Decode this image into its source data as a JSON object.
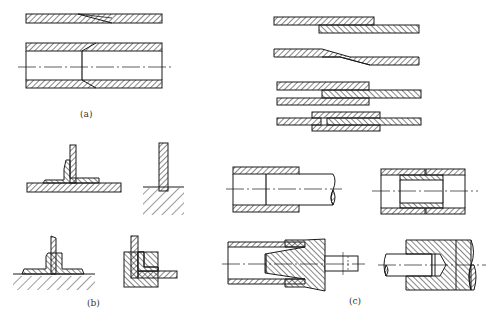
{
  "figure": {
    "type": "engineering joint cross-section drawings",
    "line_color": "#1a1a1a",
    "background": "#ffffff",
    "panels": [
      {
        "id": "a",
        "label": "(a)",
        "description": "Tube/plate scarf joints",
        "items": [
          "scarf-joint-plate",
          "scarf-joint-tube"
        ]
      },
      {
        "id": "top-right",
        "label": "",
        "description": "Plate lap joints",
        "items": [
          "lap-joint-simple",
          "lap-joint-joggled",
          "double-lap-joint",
          "double-strap-butt-joint"
        ]
      },
      {
        "id": "b",
        "label": "(b)",
        "description": "T-joints and corner joints",
        "items": [
          "t-joint-single-doubler",
          "t-joint-embedded",
          "t-joint-double-doubler",
          "corner-joint-angle"
        ]
      },
      {
        "id": "c",
        "label": "(c)",
        "description": "Tube and rod joints",
        "items": [
          "tube-sleeve-joint",
          "tube-inner-sleeve-joint",
          "tube-taper-plug-joint",
          "rod-socket-joint"
        ]
      }
    ]
  }
}
